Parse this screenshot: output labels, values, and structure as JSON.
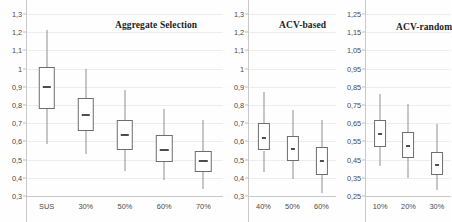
{
  "chart_data": {
    "type": "box",
    "title": "",
    "panels": [
      {
        "title": "Aggregate Selection",
        "ylim": [
          0.3,
          1.3
        ],
        "yticks": [
          "1,3",
          "1,2",
          "1,1",
          "1",
          "0,9",
          "0,8",
          "0,7",
          "0,6",
          "0,5",
          "0,4",
          "0,3"
        ],
        "ytickvalues": [
          1.3,
          1.2,
          1.1,
          1.0,
          0.9,
          0.8,
          0.7,
          0.6,
          0.5,
          0.4,
          0.3
        ],
        "categories": [
          "SUS",
          "30%",
          "50%",
          "60%",
          "70%"
        ],
        "boxes": [
          {
            "label": "SUS",
            "min": 0.585,
            "q1": 0.78,
            "median": 0.9,
            "q3": 1.01,
            "max": 1.21
          },
          {
            "label": "30%",
            "min": 0.53,
            "q1": 0.655,
            "median": 0.745,
            "q3": 0.84,
            "max": 1.0
          },
          {
            "label": "50%",
            "min": 0.44,
            "q1": 0.555,
            "median": 0.635,
            "q3": 0.715,
            "max": 0.885
          },
          {
            "label": "60%",
            "min": 0.39,
            "q1": 0.485,
            "median": 0.555,
            "q3": 0.635,
            "max": 0.78
          },
          {
            "label": "70%",
            "min": 0.34,
            "q1": 0.43,
            "median": 0.495,
            "q3": 0.545,
            "max": 0.72
          }
        ]
      },
      {
        "title": "ACV-based",
        "ylim": [
          0.3,
          1.3
        ],
        "yticks": [
          "1,3",
          "1,2",
          "1,1",
          "1",
          "0,9",
          "0,8",
          "0,7",
          "0,6",
          "0,5",
          "0,4",
          "0,3"
        ],
        "ytickvalues": [
          1.3,
          1.2,
          1.1,
          1.0,
          0.9,
          0.8,
          0.7,
          0.6,
          0.5,
          0.4,
          0.3
        ],
        "categories": [
          "40%",
          "50%",
          "60%"
        ],
        "boxes": [
          {
            "label": "40%",
            "min": 0.43,
            "q1": 0.55,
            "median": 0.62,
            "q3": 0.7,
            "max": 0.87
          },
          {
            "label": "50%",
            "min": 0.395,
            "q1": 0.49,
            "median": 0.56,
            "q3": 0.63,
            "max": 0.77
          },
          {
            "label": "60%",
            "min": 0.315,
            "q1": 0.415,
            "median": 0.49,
            "q3": 0.57,
            "max": 0.715
          }
        ]
      },
      {
        "title": "ACV-random",
        "ylim": [
          0.25,
          1.25
        ],
        "yticks": [
          "1,25",
          "1,15",
          "1,05",
          "0,95",
          "0,85",
          "0,75",
          "0,65",
          "0,55",
          "0,45",
          "0,35",
          "0,25"
        ],
        "ytickvalues": [
          1.25,
          1.15,
          1.05,
          0.95,
          0.85,
          0.75,
          0.65,
          0.55,
          0.45,
          0.35,
          0.25
        ],
        "categories": [
          "10%",
          "20%",
          "30%"
        ],
        "boxes": [
          {
            "label": "10%",
            "min": 0.415,
            "q1": 0.52,
            "median": 0.59,
            "q3": 0.665,
            "max": 0.81
          },
          {
            "label": "20%",
            "min": 0.35,
            "q1": 0.46,
            "median": 0.525,
            "q3": 0.6,
            "max": 0.755
          },
          {
            "label": "30%",
            "min": 0.285,
            "q1": 0.365,
            "median": 0.42,
            "q3": 0.49,
            "max": 0.645
          }
        ]
      }
    ],
    "grid": true,
    "legend": null,
    "xlabel": "",
    "ylabel": ""
  },
  "colors": {
    "box_stroke": "#6e6e6e",
    "whisker": "#8d8d8d",
    "median": "#4d4d4d",
    "gridline": "#ededed",
    "axis": "#c9c9c9",
    "background": "#fefefe",
    "text": "#4a4a4a",
    "title_text": "#1d1d1d"
  }
}
